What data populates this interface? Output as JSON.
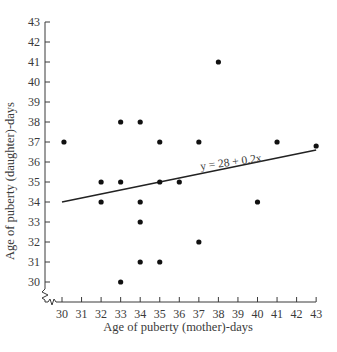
{
  "chart_data": {
    "type": "scatter",
    "title": "",
    "xlabel": "Age of puberty (mother)-days",
    "ylabel": "Age of puberty (daughter)-days",
    "xlim": [
      30,
      43
    ],
    "ylim": [
      30,
      43
    ],
    "x_ticks": [
      30,
      31,
      32,
      33,
      34,
      35,
      36,
      37,
      38,
      39,
      40,
      41,
      42,
      43
    ],
    "y_ticks": [
      30,
      31,
      32,
      33,
      34,
      35,
      36,
      37,
      38,
      39,
      40,
      41,
      42,
      43
    ],
    "grid": false,
    "legend": null,
    "axis_breaks": true,
    "series": [
      {
        "name": "observations",
        "points": [
          {
            "x": 30.1,
            "y": 37
          },
          {
            "x": 32,
            "y": 35
          },
          {
            "x": 32,
            "y": 34
          },
          {
            "x": 33,
            "y": 38
          },
          {
            "x": 33,
            "y": 35
          },
          {
            "x": 33,
            "y": 30
          },
          {
            "x": 34,
            "y": 38
          },
          {
            "x": 34,
            "y": 34
          },
          {
            "x": 34,
            "y": 33
          },
          {
            "x": 34,
            "y": 31
          },
          {
            "x": 35,
            "y": 37
          },
          {
            "x": 35,
            "y": 35
          },
          {
            "x": 35,
            "y": 31
          },
          {
            "x": 36,
            "y": 35
          },
          {
            "x": 37,
            "y": 37
          },
          {
            "x": 37,
            "y": 32
          },
          {
            "x": 38,
            "y": 41
          },
          {
            "x": 40,
            "y": 34
          },
          {
            "x": 41,
            "y": 37
          },
          {
            "x": 43,
            "y": 36.8
          }
        ]
      }
    ],
    "regression": {
      "equation": "y = 28 + 0.2x",
      "intercept": 28,
      "slope": 0.2,
      "x_range": [
        30,
        43
      ],
      "drawn_endpoints": [
        {
          "x": 30,
          "y": 34
        },
        {
          "x": 43,
          "y": 36.6
        }
      ]
    },
    "annotations": [
      {
        "text": "y = 28 + 0.2x",
        "x": 37.1,
        "y": 35.6,
        "rotation": -8
      }
    ]
  }
}
